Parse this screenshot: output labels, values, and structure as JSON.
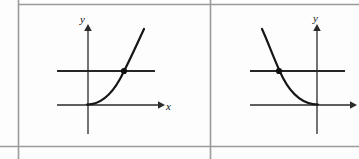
{
  "figure": {
    "background_color": "#fdfdfd",
    "frame_color": "#9b9b9b",
    "curve_color": "#161616",
    "axis_color": "#2a2a2a",
    "line_color": "#2a2a2a",
    "point_color": "#111111",
    "panels": [
      {
        "id": "left-panel",
        "name": "increasing-exponential-graph",
        "x_axis_label": "x",
        "y_axis_label": "y",
        "curve_type": "increasing-exponential",
        "has_horizontal_line": true,
        "has_intersection_point": true,
        "intersection_point": {
          "x": 124,
          "y": 71
        },
        "x_axis": {
          "y": 105,
          "x_start": 57,
          "x_end": 162
        },
        "y_axis": {
          "x": 88,
          "y_start": 27,
          "y_end": 134
        },
        "horizontal_line": {
          "y": 71,
          "x_start": 57,
          "x_end": 155
        },
        "curve_path": "M 87,104 C 97,104 110,96 120,78 C 129,62 137,43 144,29",
        "x_label_pos": {
          "x": 168,
          "y": 109
        },
        "y_label_pos": {
          "x": 83,
          "y": 23
        }
      },
      {
        "id": "right-panel",
        "name": "decreasing-exponential-graph",
        "x_axis_label": "",
        "y_axis_label": "y",
        "curve_type": "decreasing-exponential",
        "has_horizontal_line": true,
        "has_intersection_point": true,
        "intersection_point": {
          "x": 279,
          "y": 71
        },
        "x_axis": {
          "y": 105,
          "x_start": 250,
          "x_end": 356
        },
        "y_axis": {
          "x": 317,
          "y_start": 27,
          "y_end": 134
        },
        "horizontal_line": {
          "y": 71,
          "x_start": 250,
          "x_end": 345
        },
        "curve_path": "M 262,29 C 269,43 275,58 284,78 C 294,97 307,104 318,104",
        "x_label_pos": {
          "x": 359,
          "y": 109
        },
        "y_label_pos": {
          "x": 317,
          "y": 22
        }
      }
    ],
    "frame": {
      "outer_left_x": 18,
      "outer_top_y": 4,
      "outer_bottom_y": 146,
      "divider_x": 210,
      "right_edge_x": 359
    }
  }
}
